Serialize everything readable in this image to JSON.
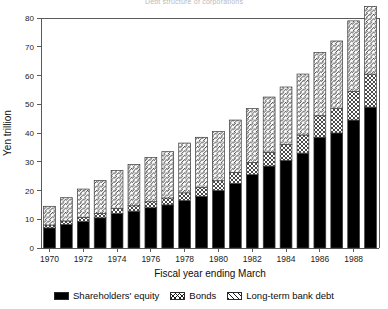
{
  "figure": {
    "title": "Debt structure of corporations",
    "ylabel": "Yen trillion",
    "xlabel": "Fiscal year ending March"
  },
  "legend": {
    "items": [
      {
        "key": "equity",
        "label": "Shareholders' equity",
        "pattern": "solid-black",
        "color": "#000000"
      },
      {
        "key": "bonds",
        "label": "Bonds",
        "pattern": "cross-hatch",
        "color": "#ffffff"
      },
      {
        "key": "debt",
        "label": "Long-term bank debt",
        "pattern": "diagonal-hatch",
        "color": "#ffffff"
      }
    ]
  },
  "chart_data": {
    "type": "bar",
    "stacked": true,
    "title": "Debt structure of corporations",
    "xlabel": "Fiscal year ending March",
    "ylabel": "Yen trillion",
    "ylim": [
      0,
      80
    ],
    "yticks": [
      0,
      10,
      20,
      30,
      40,
      50,
      60,
      70,
      80
    ],
    "xticks_labeled": [
      "1970",
      "1972",
      "1974",
      "1976",
      "1978",
      "1980",
      "1982",
      "1984",
      "1986",
      "1988"
    ],
    "grid": false,
    "legend_position": "below-axis",
    "categories": [
      "1970",
      "1971",
      "1972",
      "1973",
      "1974",
      "1975",
      "1976",
      "1977",
      "1978",
      "1979",
      "1980",
      "1981",
      "1982",
      "1983",
      "1984",
      "1985",
      "1986",
      "1987",
      "1988",
      "1989"
    ],
    "series": [
      {
        "name": "Shareholders' equity",
        "values": [
          7.0,
          8.2,
          9.2,
          10.5,
          12.0,
          12.8,
          14.0,
          15.0,
          16.5,
          18.0,
          20.0,
          22.5,
          25.5,
          28.5,
          30.5,
          33.0,
          38.5,
          40.0,
          44.5,
          49.0
        ]
      },
      {
        "name": "Bonds",
        "values": [
          1.0,
          1.2,
          1.4,
          1.5,
          1.7,
          1.9,
          2.1,
          2.4,
          2.7,
          3.0,
          3.4,
          3.8,
          4.3,
          4.8,
          5.5,
          6.3,
          7.5,
          8.5,
          10.0,
          11.5
        ]
      },
      {
        "name": "Long-term bank debt",
        "values": [
          6.5,
          8.1,
          9.9,
          11.5,
          13.3,
          14.3,
          15.4,
          16.1,
          17.3,
          17.5,
          17.1,
          18.2,
          18.7,
          19.2,
          20.0,
          21.2,
          22.0,
          23.5,
          24.5,
          23.5
        ]
      }
    ],
    "totals": [
      14.5,
      17.5,
      20.5,
      23.5,
      27.0,
      29.0,
      31.5,
      33.5,
      36.5,
      38.5,
      40.5,
      44.5,
      48.5,
      52.5,
      56.0,
      60.5,
      68.0,
      72.0,
      79.0,
      84.0
    ]
  }
}
